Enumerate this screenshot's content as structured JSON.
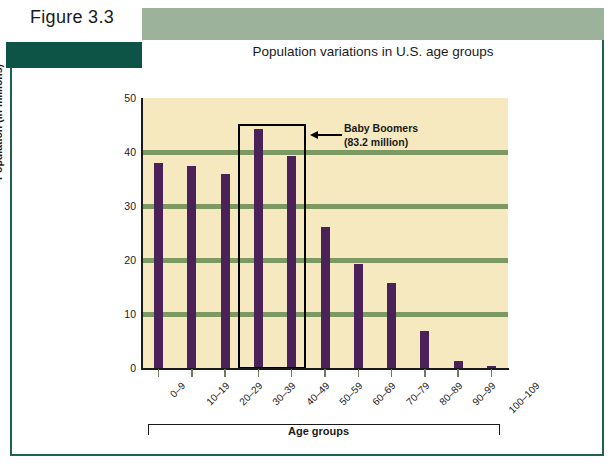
{
  "figure": {
    "label": "Figure 3.3",
    "title": "Population variations in U.S. age groups"
  },
  "colors": {
    "bar": "#4a2259",
    "gridline": "#7d9963",
    "plot_background": "#f7e9bf",
    "header_band": "#9cb29a",
    "dark_block": "#0d5447",
    "frame": "#1d6450",
    "highlight_box": "#000000"
  },
  "annotation": {
    "line1": "Baby Boomers",
    "line2": "(83.2 million)",
    "arrow_icon": "left-arrow-icon"
  },
  "chart_data": {
    "type": "bar",
    "title": "Population variations in U.S. age groups",
    "xlabel": "Age groups",
    "ylabel": "Population (in millions)",
    "categories": [
      "0–9",
      "10–19",
      "20–29",
      "30–39",
      "40–49",
      "50–59",
      "60–69",
      "70–79",
      "80–89",
      "90–99",
      "100–109"
    ],
    "values": [
      38.0,
      37.5,
      36.0,
      44.2,
      39.2,
      26.2,
      19.2,
      15.7,
      6.8,
      1.3,
      0.3
    ],
    "ylim": [
      0,
      50
    ],
    "yticks": [
      0,
      10,
      20,
      30,
      40,
      50
    ],
    "gridlines": [
      10,
      20,
      30,
      40
    ],
    "grid": true,
    "legend": "none",
    "highlight": {
      "categories": [
        "30–39",
        "40–49"
      ],
      "label": "Baby Boomers (83.2 million)",
      "total": 83.2
    }
  }
}
